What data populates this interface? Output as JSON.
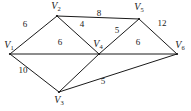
{
  "figure": {
    "name": "weighted-undirected-graph",
    "background_color": "#ffffff",
    "edge_color": "#1a1a1a",
    "text_color": "#1a1a1a"
  },
  "graph": {
    "vertices": [
      {
        "id": "V1",
        "label_letter": "V",
        "label_sub": "1",
        "x": 10,
        "y": 54,
        "label_x": 9,
        "label_y": 46
      },
      {
        "id": "V2",
        "label_letter": "V",
        "label_sub": "2",
        "x": 57,
        "y": 16,
        "label_x": 56,
        "label_y": 7
      },
      {
        "id": "V3",
        "label_letter": "V",
        "label_sub": "3",
        "x": 59,
        "y": 92,
        "label_x": 59,
        "label_y": 101
      },
      {
        "id": "V4",
        "label_letter": "V",
        "label_sub": "4",
        "x": 99,
        "y": 54,
        "label_x": 98,
        "label_y": 45
      },
      {
        "id": "V5",
        "label_letter": "V",
        "label_sub": "5",
        "x": 139,
        "y": 19,
        "label_x": 139,
        "label_y": 8
      },
      {
        "id": "V6",
        "label_letter": "V",
        "label_sub": "6",
        "x": 177,
        "y": 54,
        "label_x": 180,
        "label_y": 46
      }
    ],
    "edges": [
      {
        "from": "V1",
        "to": "V2",
        "weight": "6",
        "label_x": 25,
        "label_y": 24
      },
      {
        "from": "V1",
        "to": "V4",
        "weight": "6",
        "label_x": 60,
        "label_y": 42
      },
      {
        "from": "V1",
        "to": "V3",
        "weight": "10",
        "label_x": 23,
        "label_y": 70
      },
      {
        "from": "V2",
        "to": "V5",
        "weight": "8",
        "label_x": 99,
        "label_y": 13
      },
      {
        "from": "V2",
        "to": "V4",
        "weight": "4",
        "label_x": 82,
        "label_y": 24
      },
      {
        "from": "V4",
        "to": "V5",
        "weight": "5",
        "label_x": 117,
        "label_y": 30
      },
      {
        "from": "V4",
        "to": "V6",
        "weight": "6",
        "label_x": 138,
        "label_y": 42
      },
      {
        "from": "V5",
        "to": "V6",
        "weight": "12",
        "label_x": 162,
        "label_y": 23
      },
      {
        "from": "V3",
        "to": "V4",
        "weight": "",
        "label_x": 0,
        "label_y": 0
      },
      {
        "from": "V3",
        "to": "V6",
        "weight": "5",
        "label_x": 103,
        "label_y": 81
      }
    ]
  }
}
